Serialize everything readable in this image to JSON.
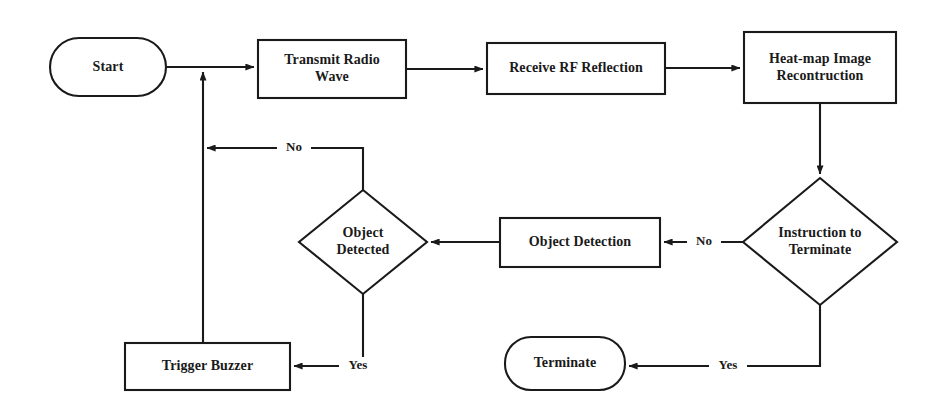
{
  "diagram": {
    "type": "flowchart",
    "title": "",
    "background_color": "#ffffff",
    "stroke_color": "#1a1a1a",
    "fill_color": "#ffffff",
    "nodes": [
      {
        "id": "start",
        "shape": "terminator",
        "label": "Start"
      },
      {
        "id": "transmit",
        "shape": "process",
        "label": "Transmit Radio\nWave"
      },
      {
        "id": "receive",
        "shape": "process",
        "label": "Receive RF Reflection"
      },
      {
        "id": "heatmap",
        "shape": "process",
        "label": "Heat-map Image\nRecontruction"
      },
      {
        "id": "instruction",
        "shape": "decision",
        "label": "Instruction to\nTerminate"
      },
      {
        "id": "detection",
        "shape": "process",
        "label": "Object Detection"
      },
      {
        "id": "detected",
        "shape": "decision",
        "label": "Object\nDetected"
      },
      {
        "id": "buzzer",
        "shape": "process",
        "label": "Trigger Buzzer"
      },
      {
        "id": "terminate",
        "shape": "terminator",
        "label": "Terminate"
      }
    ],
    "edges": [
      {
        "from": "start",
        "to": "transmit",
        "label": ""
      },
      {
        "from": "transmit",
        "to": "receive",
        "label": ""
      },
      {
        "from": "receive",
        "to": "heatmap",
        "label": ""
      },
      {
        "from": "heatmap",
        "to": "instruction",
        "label": ""
      },
      {
        "from": "instruction",
        "to": "detection",
        "label": "No"
      },
      {
        "from": "instruction",
        "to": "terminate",
        "label": "Yes"
      },
      {
        "from": "detection",
        "to": "detected",
        "label": ""
      },
      {
        "from": "detected",
        "to": "transmit",
        "label": "No"
      },
      {
        "from": "detected",
        "to": "buzzer",
        "label": "Yes"
      },
      {
        "from": "buzzer",
        "to": "transmit",
        "label": ""
      }
    ],
    "edge_labels": {
      "instruction_no": "No",
      "instruction_yes": "Yes",
      "detected_no": "No",
      "detected_yes": "Yes"
    }
  }
}
